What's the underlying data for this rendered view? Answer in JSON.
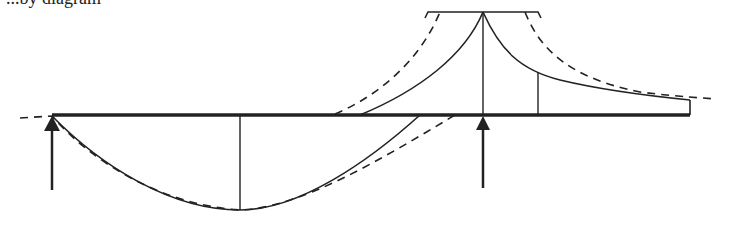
{
  "caption_fragment": "...by diagram",
  "colors": {
    "stroke": "#222222",
    "background": "#ffffff"
  },
  "diagram": {
    "type": "continuous beam bending-moment diagram with envelope",
    "beam": {
      "x1": 52,
      "x2": 690,
      "y": 115
    },
    "supports": [
      {
        "name": "left-support",
        "x": 52,
        "arrow_bottom": 190
      },
      {
        "name": "right-support",
        "x": 483,
        "arrow_bottom": 188
      }
    ],
    "ordinates": [
      {
        "name": "max-sag-ordinate",
        "x": 240,
        "y_top": 115,
        "y_bottom": 210
      },
      {
        "name": "support-hogging-ordinate",
        "x": 483,
        "y_top": 12,
        "y_bottom": 115
      },
      {
        "name": "overhang-ordinate",
        "x": 538,
        "y_top": 72,
        "y_bottom": 115
      },
      {
        "name": "end-ordinate",
        "x": 690,
        "y_top": 100,
        "y_bottom": 115
      }
    ],
    "peak_bracket": {
      "x1": 425,
      "x2": 540,
      "y": 12
    },
    "legend": {
      "solid": "bending moment",
      "dashed": "envelope"
    }
  }
}
